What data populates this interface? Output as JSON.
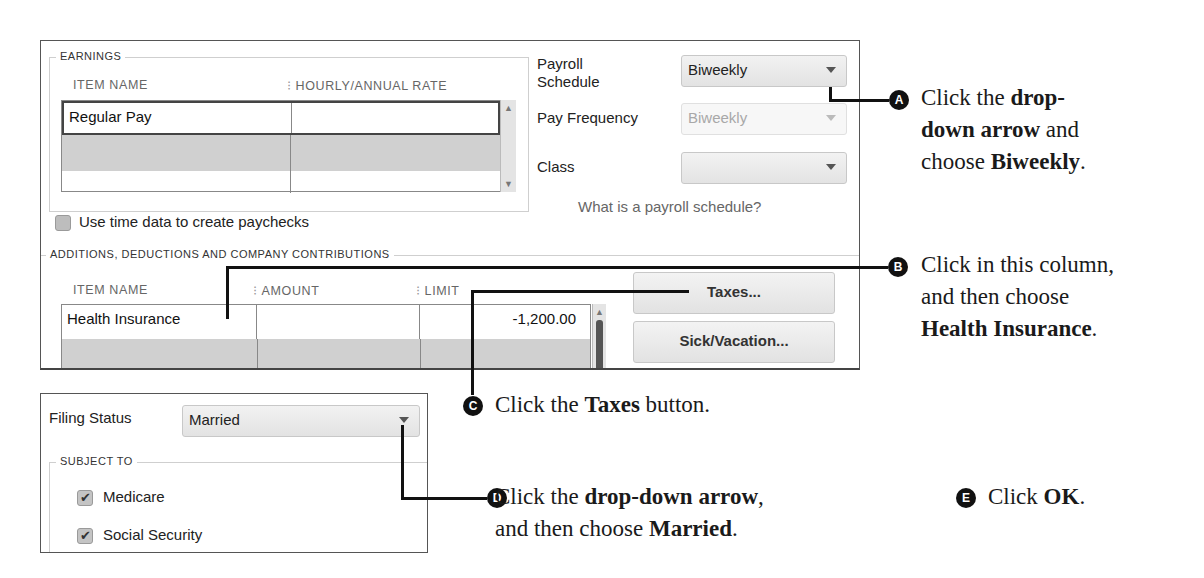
{
  "earnings": {
    "group_label": "EARNINGS",
    "columns": [
      "ITEM NAME",
      "HOURLY/ANNUAL RATE"
    ],
    "rows": [
      {
        "item_name": "Regular Pay",
        "rate": ""
      },
      {
        "item_name": "",
        "rate": ""
      },
      {
        "item_name": "",
        "rate": ""
      }
    ],
    "use_time_data_label": "Use time data to create paychecks",
    "use_time_data_checked": false
  },
  "schedule": {
    "payroll_schedule_label_1": "Payroll",
    "payroll_schedule_label_2": "Schedule",
    "payroll_schedule_value": "Biweekly",
    "pay_frequency_label": "Pay Frequency",
    "pay_frequency_value": "Biweekly",
    "class_label": "Class",
    "class_value": "",
    "help_link": "What is a payroll schedule?"
  },
  "additions": {
    "group_label": "ADDITIONS, DEDUCTIONS AND COMPANY CONTRIBUTIONS",
    "columns": [
      "ITEM NAME",
      "AMOUNT",
      "LIMIT"
    ],
    "rows": [
      {
        "item_name": "Health Insurance",
        "amount": "",
        "limit": "-1,200.00"
      },
      {
        "item_name": "",
        "amount": "",
        "limit": ""
      }
    ]
  },
  "buttons": {
    "taxes": "Taxes...",
    "sick_vacation": "Sick/Vacation..."
  },
  "taxes_dialog": {
    "filing_status_label": "Filing Status",
    "filing_status_value": "Married",
    "subject_to_label": "SUBJECT TO",
    "items": [
      {
        "label": "Medicare",
        "checked": true
      },
      {
        "label": "Social Security",
        "checked": true
      }
    ]
  },
  "callouts": {
    "A": {
      "badge": "A",
      "pre": "Click the ",
      "bold1": "drop-",
      "line2_bold": "down arrow",
      "line2_rest": " and",
      "line3_pre": "choose ",
      "line3_bold": "Biweekly",
      "line3_end": "."
    },
    "B": {
      "badge": "B",
      "line1": "Click in this column,",
      "line2": "and then choose",
      "line3_bold": "Health Insurance",
      "line3_end": "."
    },
    "C": {
      "badge": "C",
      "pre": "Click the ",
      "bold": "Taxes",
      "post": " button."
    },
    "D": {
      "badge": "D",
      "pre": "Click the ",
      "bold": "drop-down arrow",
      "post": ",",
      "line2_pre": "and then choose ",
      "line2_bold": "Married",
      "line2_end": "."
    },
    "E": {
      "badge": "E",
      "pre": "Click ",
      "bold": "OK",
      "post": "."
    }
  }
}
